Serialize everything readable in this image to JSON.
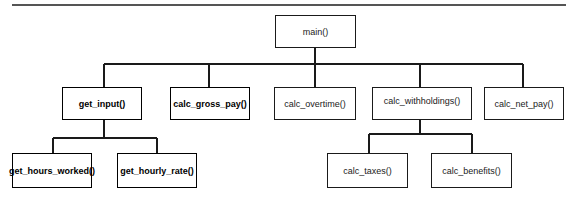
{
  "diagram": {
    "type": "hierarchy-chart",
    "nodes": [
      {
        "id": "main",
        "label": "main()",
        "parent": null,
        "emphasis": false,
        "box": {
          "x": 275,
          "y": 15,
          "w": 81,
          "h": 33
        }
      },
      {
        "id": "get_input",
        "label": "get_input()",
        "parent": "main",
        "emphasis": true,
        "box": {
          "x": 62,
          "y": 87,
          "w": 80,
          "h": 33
        }
      },
      {
        "id": "calc_gross_pay",
        "label": "calc_gross_pay()",
        "parent": "main",
        "emphasis": true,
        "box": {
          "x": 170,
          "y": 87,
          "w": 80,
          "h": 33
        }
      },
      {
        "id": "calc_overtime",
        "label": "calc_overtime()",
        "parent": "main",
        "emphasis": false,
        "box": {
          "x": 274,
          "y": 87,
          "w": 82,
          "h": 33
        }
      },
      {
        "id": "calc_withholdings",
        "label": "calc_withholdings()",
        "parent": "main",
        "emphasis": false,
        "box": {
          "x": 372,
          "y": 87,
          "w": 100,
          "h": 33
        }
      },
      {
        "id": "calc_net_pay",
        "label": "calc_net_pay()",
        "parent": "main",
        "emphasis": false,
        "box": {
          "x": 484,
          "y": 87,
          "w": 80,
          "h": 33
        }
      },
      {
        "id": "get_hours_worked",
        "label": "get_hours_worked()",
        "parent": "get_input",
        "emphasis": true,
        "box": {
          "x": 12,
          "y": 153,
          "w": 80,
          "h": 35
        }
      },
      {
        "id": "get_hourly_rate",
        "label": "get_hourly_rate()",
        "parent": "get_input",
        "emphasis": true,
        "box": {
          "x": 117,
          "y": 153,
          "w": 80,
          "h": 35
        }
      },
      {
        "id": "calc_taxes",
        "label": "calc_taxes()",
        "parent": "calc_withholdings",
        "emphasis": false,
        "box": {
          "x": 327,
          "y": 153,
          "w": 81,
          "h": 35
        }
      },
      {
        "id": "calc_benefits",
        "label": "calc_benefits()",
        "parent": "calc_withholdings",
        "emphasis": false,
        "box": {
          "x": 431,
          "y": 153,
          "w": 81,
          "h": 35
        }
      }
    ],
    "edges": [
      {
        "from": "main",
        "to": "get_input"
      },
      {
        "from": "main",
        "to": "calc_gross_pay"
      },
      {
        "from": "main",
        "to": "calc_overtime"
      },
      {
        "from": "main",
        "to": "calc_withholdings"
      },
      {
        "from": "main",
        "to": "calc_net_pay"
      },
      {
        "from": "get_input",
        "to": "get_hours_worked"
      },
      {
        "from": "get_input",
        "to": "get_hourly_rate"
      },
      {
        "from": "calc_withholdings",
        "to": "calc_taxes"
      },
      {
        "from": "calc_withholdings",
        "to": "calc_benefits"
      }
    ]
  },
  "labels": {
    "main": "main()",
    "get_input": "get_input()",
    "calc_gross_pay": "calc_gross_pay()",
    "calc_overtime": "calc_overtime()",
    "calc_withholdings": "calc_withholdings()",
    "calc_net_pay": "calc_net_pay()",
    "get_hours_worked": "get_hours_worked()",
    "get_hourly_rate": "get_hourly_rate()",
    "calc_taxes": "calc_taxes()",
    "calc_benefits": "calc_benefits()"
  },
  "colors": {
    "line": "#1a1a1a",
    "rule": "#555555",
    "background": "#ffffff"
  }
}
